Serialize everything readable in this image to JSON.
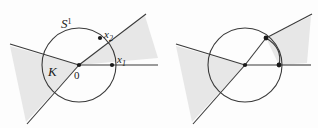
{
  "figure": {
    "background_color": "#fdfdfd",
    "stroke_color": "#3a3a3a",
    "shade_color": "#e7e7e7",
    "shade_stroke": "#c8c8c8",
    "point_color": "#1a1a1a",
    "labels": {
      "circle_label": "S",
      "circle_superscript": "1",
      "cone_label": "K",
      "origin_label": "0",
      "point1_label": "x",
      "point1_subscript": "1",
      "point2_label": "x",
      "point2_subscript": "2"
    },
    "panels": [
      {
        "name": "left-panel",
        "center": {
          "x": 79,
          "y": 65
        },
        "radius": 37,
        "labelled": true,
        "points": [
          {
            "name": "x1",
            "x": 112,
            "y": 65
          },
          {
            "name": "x2",
            "x": 100,
            "y": 38
          },
          {
            "name": "origin",
            "x": 79,
            "y": 65
          }
        ]
      },
      {
        "name": "right-panel",
        "center": {
          "x": 245,
          "y": 65
        },
        "radius": 37,
        "labelled": false,
        "points": [
          {
            "name": "x1",
            "x": 278,
            "y": 65
          },
          {
            "name": "x2",
            "x": 266,
            "y": 38
          },
          {
            "name": "origin",
            "x": 245,
            "y": 65
          }
        ]
      }
    ]
  }
}
